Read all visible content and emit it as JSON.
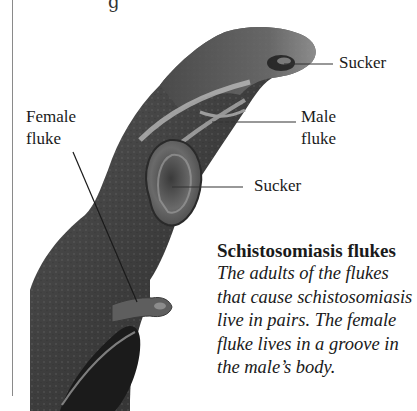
{
  "page": {
    "top_fragment": "g"
  },
  "labels": {
    "sucker_top": "Sucker",
    "male_fluke_line1": "Male",
    "male_fluke_line2": "fluke",
    "female_fluke_line1": "Female",
    "female_fluke_line2": "fluke",
    "sucker_middle": "Sucker"
  },
  "caption": {
    "title": "Schistosomiasis flukes",
    "body_lines": [
      "The adults of the flukes",
      "that cause schistosomiasis",
      "live in pairs. The female",
      "fluke lives in a groove in",
      "the male’s body."
    ]
  },
  "colors": {
    "text": "#1a1a1a",
    "rule": "#8a8a8a",
    "leader": "#333333"
  }
}
